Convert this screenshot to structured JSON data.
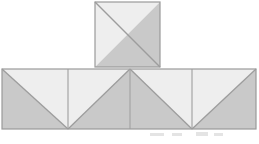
{
  "figure": {
    "canvas": {
      "width": 259,
      "height": 144,
      "background_color": "#ffffff"
    },
    "palette": {
      "light_fill": "#eeeeee",
      "mid_fill": "#e4e4e4",
      "dark_fill": "#c9c9c9",
      "darker_fill": "#c2c2c2",
      "outline": "#9a9a9a",
      "diagonal_stroke": "#9d9d9d",
      "divider_stroke": "#a5a5a5",
      "artifact_color": "#dcdcdc"
    },
    "top_square": {
      "label": "top-square",
      "x": 95,
      "y": 2,
      "size": 65,
      "diagonal": "top-left-to-bottom-right",
      "upper_triangle_shade": "light",
      "lower_triangle_shade": "dark"
    },
    "strip": {
      "label": "bottom-strip",
      "x": 2,
      "y": 69,
      "width": 254,
      "height": 60,
      "square_count": 4,
      "divider_positions": [
        2,
        68,
        130,
        192,
        256
      ],
      "squares": [
        {
          "label": "strip-square-1",
          "index": 1,
          "x": 2,
          "width": 66,
          "diagonal": "top-left-to-bottom-right",
          "upper_triangle_shade": "light",
          "lower_triangle_shade": "dark"
        },
        {
          "label": "strip-square-2",
          "index": 2,
          "x": 68,
          "width": 62,
          "diagonal": "top-right-to-bottom-left",
          "upper_triangle_shade": "light",
          "lower_triangle_shade": "dark"
        },
        {
          "label": "strip-square-3",
          "index": 3,
          "x": 130,
          "width": 62,
          "diagonal": "top-left-to-bottom-right",
          "upper_triangle_shade": "light",
          "lower_triangle_shade": "dark"
        },
        {
          "label": "strip-square-4",
          "index": 4,
          "x": 192,
          "width": 64,
          "diagonal": "top-right-to-bottom-left",
          "upper_triangle_shade": "light",
          "lower_triangle_shade": "dark"
        }
      ]
    },
    "artifacts": [
      {
        "label": "scan-smudge-1",
        "x": 150,
        "y": 133,
        "width": 14,
        "height": 3
      },
      {
        "label": "scan-smudge-2",
        "x": 172,
        "y": 133,
        "width": 10,
        "height": 3
      },
      {
        "label": "scan-smudge-3",
        "x": 196,
        "y": 132,
        "width": 12,
        "height": 4
      },
      {
        "label": "scan-smudge-4",
        "x": 214,
        "y": 133,
        "width": 9,
        "height": 3
      }
    ]
  }
}
